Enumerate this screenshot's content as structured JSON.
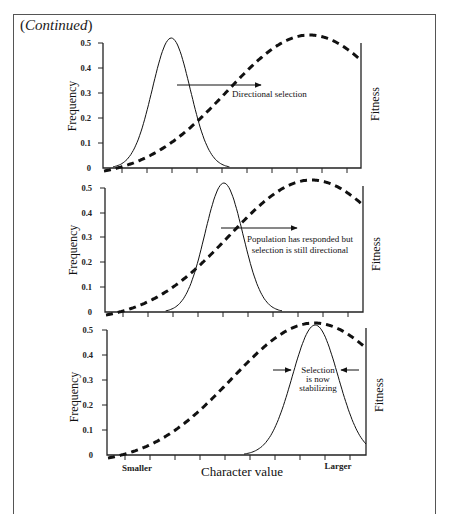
{
  "header": {
    "prefix": "(",
    "label": "Continued",
    "suffix": ")"
  },
  "chart_data": [
    {
      "type": "line",
      "title": "Directional selection",
      "ylabel": "Frequency",
      "y2label": "Fitness",
      "yticks": [
        "0",
        "0.1",
        "0.2",
        "0.3",
        "0.4",
        "0.5"
      ],
      "ylim": [
        0,
        0.5
      ],
      "annotation": [
        "Directional selection"
      ],
      "series": [
        {
          "name": "Population frequency distribution",
          "style": "solid",
          "mean": 0.25,
          "sd": 0.075,
          "peak": 0.52
        },
        {
          "name": "Fitness",
          "style": "dashed",
          "optimum": 0.8
        }
      ]
    },
    {
      "type": "line",
      "title": "Population has responded but selection is still directional",
      "ylabel": "Frequency",
      "y2label": "Fitness",
      "yticks": [
        "0",
        "0.1",
        "0.2",
        "0.3",
        "0.4",
        "0.5"
      ],
      "ylim": [
        0,
        0.5
      ],
      "annotation": [
        "Population has responded but",
        "selection is still directional"
      ],
      "series": [
        {
          "name": "Population frequency distribution",
          "style": "solid",
          "mean": 0.45,
          "sd": 0.075,
          "peak": 0.52
        },
        {
          "name": "Fitness",
          "style": "dashed",
          "optimum": 0.8
        }
      ]
    },
    {
      "type": "line",
      "title": "Selection is now stabilizing",
      "ylabel": "Frequency",
      "y2label": "Fitness",
      "yticks": [
        "0",
        "0.1",
        "0.2",
        "0.3",
        "0.4",
        "0.5"
      ],
      "ylim": [
        0,
        0.5
      ],
      "xlabel": "Character value",
      "xticklabels": {
        "left": "Smaller",
        "right": "Larger"
      },
      "annotation": [
        "Selection",
        "is now",
        "stabilizing"
      ],
      "series": [
        {
          "name": "Population frequency distribution",
          "style": "solid",
          "mean": 0.8,
          "sd": 0.09,
          "peak": 0.52
        },
        {
          "name": "Fitness",
          "style": "dashed",
          "optimum": 0.8
        }
      ]
    }
  ],
  "panels": [
    {
      "ylabel": "Frequency",
      "y2label": "Fitness",
      "annotation": "Directional selection"
    },
    {
      "ylabel": "Frequency",
      "y2label": "Fitness",
      "annotation_line1": "Population has responded but",
      "annotation_line2": "selection is still directional"
    },
    {
      "ylabel": "Frequency",
      "y2label": "Fitness",
      "annotation_line1": "Selection",
      "annotation_line2": "is now",
      "annotation_line3": "stabilizing"
    }
  ],
  "xaxis": {
    "left_label": "Smaller",
    "right_label": "Larger",
    "title": "Character value"
  },
  "colors": {
    "ink": "#1a1a1a",
    "frame": "#555555"
  }
}
